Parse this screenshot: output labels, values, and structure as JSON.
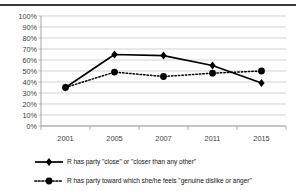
{
  "chart_data": {
    "type": "line",
    "title": "",
    "subtitle": "",
    "xlabel": "",
    "ylabel": "",
    "categories": [
      "2001",
      "2005",
      "2007",
      "2011",
      "2015"
    ],
    "x": [
      2001,
      2005,
      2007,
      2011,
      2015
    ],
    "series": [
      {
        "name": "R has party \"close\" or \"closer than any other\"",
        "values": [
          35,
          65,
          64,
          55,
          39
        ],
        "line_style": "solid",
        "marker": "diamond",
        "color": "#000000"
      },
      {
        "name": "R has party toward which she/he feels \"genuine dislike or anger\"",
        "values": [
          35,
          49,
          45,
          48,
          50
        ],
        "line_style": "dotted",
        "marker": "circle",
        "color": "#000000"
      }
    ],
    "ylim": [
      0,
      100
    ],
    "ytick_values": [
      0,
      10,
      20,
      30,
      40,
      50,
      60,
      70,
      80,
      90,
      100
    ],
    "ytick_labels": [
      "0%",
      "10%",
      "20%",
      "30%",
      "40%",
      "50%",
      "60%",
      "70%",
      "80%",
      "90%",
      "100%"
    ],
    "xtick_labels": [
      "2001",
      "2005",
      "2007",
      "2011",
      "2015"
    ],
    "grid": "horizontal",
    "legend_position": "bottom-left",
    "plot_background": "#ffffff",
    "gridline_color": "#bfbfbf",
    "axis_color": "#9a9a9a"
  },
  "legend": {
    "items": [
      {
        "label": "R has party \"close\" or \"closer than any other\"",
        "marker": "diamond-solid-line-key"
      },
      {
        "label": "R has party toward which she/he feels \"genuine dislike or anger\"",
        "marker": "circle-dotted-line-key"
      }
    ]
  },
  "decorations": {
    "top_rule_color": "#3a3a3c"
  }
}
